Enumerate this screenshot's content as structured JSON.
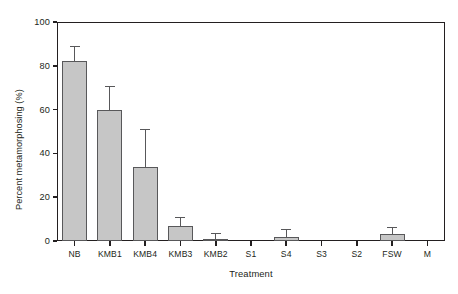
{
  "chart_data": {
    "type": "bar",
    "title": "",
    "xlabel": "Treatment",
    "ylabel": "Percent metamorphosing (%)",
    "categories": [
      "NB",
      "KMB1",
      "KMB4",
      "KMB3",
      "KMB2",
      "S1",
      "S4",
      "S3",
      "S2",
      "FSW",
      "M"
    ],
    "values": [
      82,
      60,
      34,
      7,
      1,
      0,
      2,
      0,
      0,
      3,
      0
    ],
    "errors": [
      7,
      11,
      17,
      4,
      2.5,
      0,
      3.5,
      0,
      0,
      3.5,
      0
    ],
    "ylim": [
      0,
      100
    ],
    "yticks": [
      0,
      20,
      40,
      60,
      80,
      100
    ],
    "ytick_labels": [
      "0",
      "20",
      "40",
      "60",
      "80",
      "100"
    ],
    "grid": false,
    "legend": null,
    "bar_fill_color": "#c6c6c6",
    "bar_edge_color": "#58585a",
    "axis_color": "#231f20",
    "error_bar_type": "standard-deviation"
  }
}
